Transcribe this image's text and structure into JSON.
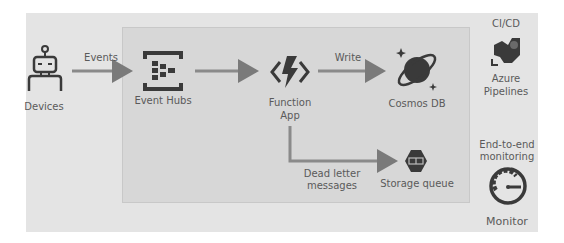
{
  "diagram": {
    "nodes": {
      "devices": {
        "label": "Devices",
        "icon": "robot-icon"
      },
      "event_hubs": {
        "label": "Event Hubs",
        "icon": "event-hubs-icon"
      },
      "function_app": {
        "label_line1": "Function",
        "label_line2": "App",
        "icon": "function-lightning-icon"
      },
      "cosmos_db": {
        "label": "Cosmos DB",
        "icon": "cosmos-planet-icon"
      },
      "storage_queue": {
        "label": "Storage queue",
        "icon": "storage-queue-icon"
      },
      "azure_pipelines": {
        "header": "CI/CD",
        "label_line1": "Azure",
        "label_line2": "Pipelines",
        "icon": "pipelines-icon"
      },
      "monitor": {
        "header_line1": "End-to-end",
        "header_line2": "monitoring",
        "label": "Monitor",
        "icon": "gauge-icon"
      }
    },
    "edges": {
      "events": {
        "from": "Devices",
        "to": "Event Hubs",
        "label": "Events"
      },
      "eh_to_func": {
        "from": "Event Hubs",
        "to": "Function App",
        "label": ""
      },
      "write": {
        "from": "Function App",
        "to": "Cosmos DB",
        "label": "Write"
      },
      "dead_letter": {
        "from": "Function App",
        "to": "Storage queue",
        "label_line1": "Dead letter",
        "label_line2": "messages"
      }
    },
    "colors": {
      "outer_bg": "#e4e4e4",
      "inner_bg": "#d7d7d7",
      "icon": "#3a3a3a",
      "arrow": "#7a7a7a"
    }
  }
}
